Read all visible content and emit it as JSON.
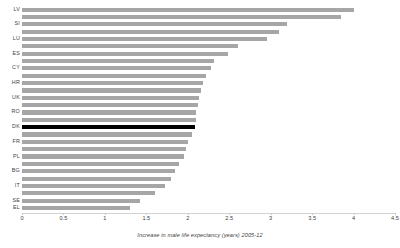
{
  "chart_data": {
    "type": "bar",
    "orientation": "horizontal",
    "title": "",
    "xlabel": "Increase in male life expectancy (years) 2005-12",
    "ylabel": "",
    "xlim": [
      0,
      4.5
    ],
    "xticks": [
      0,
      0.5,
      1,
      1.5,
      2,
      2.5,
      3,
      3.5,
      4,
      4.5
    ],
    "xtick_labels": [
      "0",
      "0.5",
      "1",
      "1.5",
      "2",
      "2.5",
      "3",
      "3.5",
      "4",
      "4.5"
    ],
    "grid": false,
    "legend": null,
    "bar_color": "#a6a6a6",
    "highlight_color": "#000000",
    "highlight_category": "DK",
    "categories": [
      "LV",
      "LT",
      "SI",
      "EE",
      "LU",
      "MT",
      "ES",
      "PT",
      "CY",
      "FI",
      "HR",
      "IE",
      "UK",
      "AT",
      "RO",
      "CZ",
      "DK",
      "DE",
      "FR",
      "BE",
      "PL",
      "NL",
      "BG",
      "SK",
      "IT",
      "HU",
      "SE",
      "EL"
    ],
    "visible_tick_labels": [
      "LV",
      "",
      "SI",
      "",
      "LU",
      "",
      "ES",
      "",
      "CY",
      "",
      "HR",
      "",
      "UK",
      "",
      "RO",
      "",
      "DK",
      "",
      "FR",
      "",
      "PL",
      "",
      "BG",
      "",
      "IT",
      "",
      "SE",
      "EL"
    ],
    "values": [
      4.0,
      3.85,
      3.2,
      3.1,
      2.95,
      2.6,
      2.48,
      2.32,
      2.28,
      2.22,
      2.18,
      2.16,
      2.14,
      2.12,
      2.1,
      2.1,
      2.09,
      2.05,
      2.0,
      1.98,
      1.95,
      1.9,
      1.85,
      1.8,
      1.72,
      1.6,
      1.42,
      1.3
    ]
  }
}
